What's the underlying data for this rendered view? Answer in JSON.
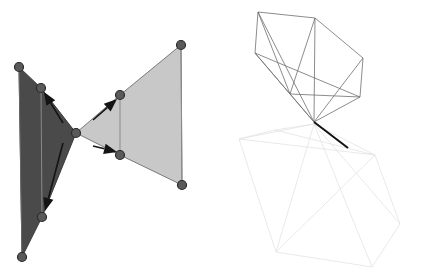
{
  "figure": {
    "canvas": {
      "width": 424,
      "height": 277,
      "background": "#ffffff"
    },
    "panels": [
      {
        "id": "left-panel",
        "name": "filled-polygon-figure",
        "description": "Two filled quadrilateral fans meeting at a central apex, with vertex dots and direction arrows"
      },
      {
        "id": "right-panel",
        "name": "wireframe-cone-figure",
        "description": "Wireframe polyhedral cone converging to an apex with a faint mirrored cone below"
      }
    ]
  },
  "chart_data": {
    "type": "scatter",
    "xlabel": "",
    "ylabel": "",
    "xlim": [
      0,
      424
    ],
    "ylim": [
      0,
      277
    ],
    "grid": false,
    "legend": "none",
    "colors": {
      "dark_fill": "#4a4a4a",
      "light_fill": "#c8c8c8",
      "outline": "#555555",
      "vertex": "#5a5a5a",
      "vertex_edge": "#2e2e2e",
      "arrow": "#1a1a1a",
      "wire_strong": "#6e6e6e",
      "wire_faint": "#e2e2e2",
      "wire_accent": "#111111",
      "background": "#ffffff"
    },
    "series": [
      {
        "name": "left-dark-polygon",
        "kind": "polygon",
        "fill": "#4a4a4a",
        "stroke": "#3a3a3a",
        "points": [
          [
            19,
            67
          ],
          [
            41,
            88
          ],
          [
            76,
            133
          ],
          [
            42,
            217
          ],
          [
            22,
            257
          ]
        ]
      },
      {
        "name": "left-dark-inner-edge",
        "kind": "polyline",
        "stroke": "#8a8a8a",
        "points": [
          [
            41,
            88
          ],
          [
            42,
            217
          ]
        ]
      },
      {
        "name": "left-dark-outer-edge",
        "kind": "polyline",
        "stroke": "#6a6a6a",
        "points": [
          [
            19,
            67
          ],
          [
            22,
            257
          ]
        ]
      },
      {
        "name": "right-light-polygon",
        "kind": "polygon",
        "fill": "#c8c8c8",
        "stroke": "#7a7a7a",
        "points": [
          [
            76,
            133
          ],
          [
            120,
            95
          ],
          [
            181,
            45
          ],
          [
            182,
            185
          ],
          [
            120,
            155
          ]
        ]
      },
      {
        "name": "right-light-inner-edge",
        "kind": "polyline",
        "stroke": "#8a8a8a",
        "points": [
          [
            120,
            95
          ],
          [
            120,
            155
          ]
        ]
      },
      {
        "name": "right-light-outer-edge",
        "kind": "polyline",
        "stroke": "#8a8a8a",
        "points": [
          [
            181,
            45
          ],
          [
            182,
            185
          ]
        ]
      },
      {
        "name": "vertices",
        "kind": "points",
        "radius": 4.5,
        "fill": "#5a5a5a",
        "stroke": "#2b2b2b",
        "points": [
          [
            19,
            67
          ],
          [
            41,
            88
          ],
          [
            76,
            133
          ],
          [
            42,
            217
          ],
          [
            22,
            257
          ],
          [
            120,
            95
          ],
          [
            181,
            45
          ],
          [
            120,
            155
          ],
          [
            182,
            185
          ]
        ]
      },
      {
        "name": "direction-arrows",
        "kind": "arrows",
        "color": "#141414",
        "arrows": [
          {
            "from": [
              63,
              123
            ],
            "to": [
              44,
              92
            ]
          },
          {
            "from": [
              63,
              143
            ],
            "to": [
              45,
              211
            ]
          },
          {
            "from": [
              93,
              120
            ],
            "to": [
              117,
              99
            ]
          },
          {
            "from": [
              93,
              146
            ],
            "to": [
              117,
              152
            ]
          }
        ]
      },
      {
        "name": "wireframe-upper-cone",
        "kind": "wireframe",
        "stroke": "#6e6e6e",
        "apex": [
          314,
          122
        ],
        "rim": [
          [
            258,
            12
          ],
          [
            315,
            18
          ],
          [
            363,
            58
          ],
          [
            360,
            97
          ],
          [
            290,
            94
          ],
          [
            255,
            53
          ]
        ],
        "edges": [
          [
            [
              258,
              12
            ],
            [
              315,
              18
            ]
          ],
          [
            [
              315,
              18
            ],
            [
              363,
              58
            ]
          ],
          [
            [
              363,
              58
            ],
            [
              360,
              97
            ]
          ],
          [
            [
              360,
              97
            ],
            [
              290,
              94
            ]
          ],
          [
            [
              290,
              94
            ],
            [
              255,
              53
            ]
          ],
          [
            [
              255,
              53
            ],
            [
              258,
              12
            ]
          ],
          [
            [
              258,
              12
            ],
            [
              290,
              94
            ]
          ],
          [
            [
              315,
              18
            ],
            [
              290,
              94
            ]
          ],
          [
            [
              255,
              53
            ],
            [
              360,
              97
            ]
          ],
          [
            [
              314,
              122
            ],
            [
              258,
              12
            ]
          ],
          [
            [
              314,
              122
            ],
            [
              315,
              18
            ]
          ],
          [
            [
              314,
              122
            ],
            [
              363,
              58
            ]
          ],
          [
            [
              314,
              122
            ],
            [
              360,
              97
            ]
          ],
          [
            [
              314,
              122
            ],
            [
              290,
              94
            ]
          ],
          [
            [
              314,
              122
            ],
            [
              255,
              53
            ]
          ]
        ]
      },
      {
        "name": "wireframe-lower-cone-faint",
        "kind": "wireframe",
        "stroke": "#e3e3e3",
        "apex": [
          314,
          124
        ],
        "rim": [
          [
            239,
            139
          ],
          [
            275,
            130
          ],
          [
            375,
            155
          ],
          [
            400,
            224
          ],
          [
            372,
            267
          ],
          [
            276,
            252
          ]
        ],
        "edges": [
          [
            [
              239,
              139
            ],
            [
              275,
              130
            ]
          ],
          [
            [
              275,
              130
            ],
            [
              375,
              155
            ]
          ],
          [
            [
              375,
              155
            ],
            [
              400,
              224
            ]
          ],
          [
            [
              400,
              224
            ],
            [
              372,
              267
            ]
          ],
          [
            [
              372,
              267
            ],
            [
              276,
              252
            ]
          ],
          [
            [
              276,
              252
            ],
            [
              239,
              139
            ]
          ],
          [
            [
              314,
              124
            ],
            [
              239,
              139
            ]
          ],
          [
            [
              314,
              124
            ],
            [
              275,
              130
            ]
          ],
          [
            [
              314,
              124
            ],
            [
              375,
              155
            ]
          ],
          [
            [
              314,
              124
            ],
            [
              400,
              224
            ]
          ],
          [
            [
              314,
              124
            ],
            [
              372,
              267
            ]
          ],
          [
            [
              314,
              124
            ],
            [
              276,
              252
            ]
          ],
          [
            [
              239,
              139
            ],
            [
              375,
              155
            ]
          ],
          [
            [
              276,
              252
            ],
            [
              375,
              155
            ]
          ]
        ]
      },
      {
        "name": "wireframe-apex-ray",
        "kind": "polyline",
        "stroke": "#111111",
        "points": [
          [
            314,
            122
          ],
          [
            348,
            148
          ]
        ]
      }
    ]
  }
}
